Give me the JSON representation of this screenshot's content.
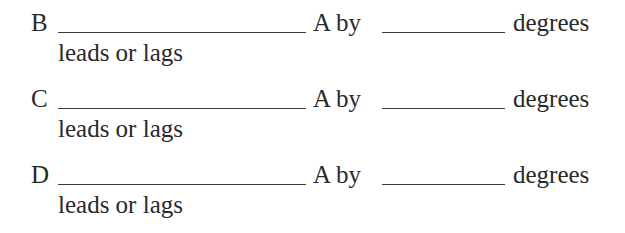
{
  "rows": [
    {
      "label": "B",
      "middle": "A by",
      "unit": "degrees",
      "hint": "leads or lags",
      "answer1": "",
      "answer2": ""
    },
    {
      "label": "C",
      "middle": "A by",
      "unit": "degrees",
      "hint": "leads or lags",
      "answer1": "",
      "answer2": ""
    },
    {
      "label": "D",
      "middle": "A by",
      "unit": "degrees",
      "hint": "leads or lags",
      "answer1": "",
      "answer2": ""
    }
  ]
}
